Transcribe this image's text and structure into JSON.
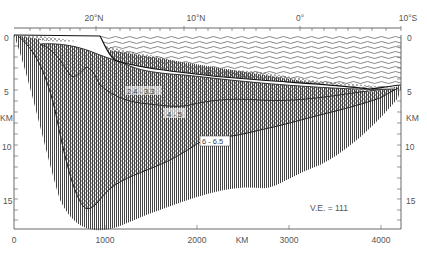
{
  "figure": {
    "type": "seismic refraction cross-section",
    "top_axis": {
      "labels": [
        "20°N",
        "10°N",
        "0°",
        "10°S"
      ]
    },
    "bottom_axis": {
      "unit_label": "KM",
      "ticks": [
        "0",
        "1000",
        "2000",
        "3000",
        "4000"
      ]
    },
    "left_axis": {
      "unit_label": "KM",
      "ticks": [
        "0",
        "5",
        "10",
        "15"
      ]
    },
    "right_axis": {
      "unit_label": "KM",
      "ticks": [
        "0",
        "5",
        "10",
        "15"
      ]
    },
    "layers": [
      {
        "name": "water",
        "label": ""
      },
      {
        "name": "layer-1",
        "label": "1.6 - 2.3  km/sec"
      },
      {
        "name": "layer-2",
        "label": "2.4 - 3.3"
      },
      {
        "name": "layer-3",
        "label": "4 - 5"
      },
      {
        "name": "layer-4",
        "label": "6 - 6.5"
      }
    ],
    "annotation": "V.E. = 111"
  }
}
